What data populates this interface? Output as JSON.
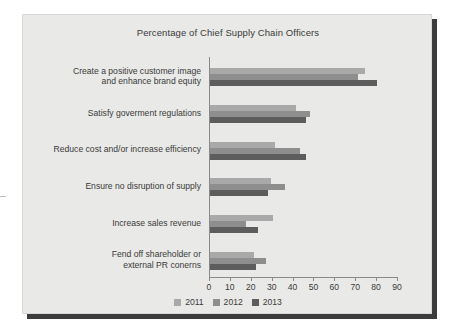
{
  "chart_data": {
    "type": "bar",
    "orientation": "horizontal",
    "title": "Percentage of Chief Supply Chain Officers",
    "xlabel": "",
    "ylabel": "",
    "xlim": [
      0,
      90
    ],
    "xticks": [
      0,
      10,
      20,
      30,
      40,
      50,
      60,
      70,
      80,
      90
    ],
    "grid": false,
    "legend_position": "bottom",
    "categories": [
      "Create a positive customer image and enhance brand equity",
      "Satisfy goverment regulations",
      "Reduce cost and/or increase efficiency",
      "Ensure no disruption of supply",
      "Increase sales revenue",
      "Fend off shareholder or external PR conerns"
    ],
    "category_lines": [
      [
        "Create a positive customer image",
        "and enhance brand equity"
      ],
      [
        "Satisfy goverment regulations"
      ],
      [
        "Reduce cost and/or increase efficiency"
      ],
      [
        "Ensure no disruption of supply"
      ],
      [
        "Increase sales revenue"
      ],
      [
        "Fend off shareholder or",
        "external PR conerns"
      ]
    ],
    "series": [
      {
        "name": "2011",
        "color": "#a9a9a9",
        "values": [
          74,
          41,
          31,
          29,
          30,
          21
        ]
      },
      {
        "name": "2012",
        "color": "#8e8e8e",
        "values": [
          71,
          48,
          43,
          36,
          17,
          27
        ]
      },
      {
        "name": "2013",
        "color": "#5d5d5d",
        "values": [
          80,
          46,
          46,
          28,
          23,
          22
        ]
      }
    ]
  },
  "legend": {
    "items": [
      {
        "label": "2011",
        "color": "#a9a9a9"
      },
      {
        "label": "2012",
        "color": "#8e8e8e"
      },
      {
        "label": "2013",
        "color": "#5d5d5d"
      }
    ]
  },
  "colors": {
    "panel_background": "#e9e9e7",
    "page_background": "#ffffff",
    "shadow": "#3c3c3c",
    "axis": "#8a8a8a",
    "text": "#3a3a3a"
  }
}
